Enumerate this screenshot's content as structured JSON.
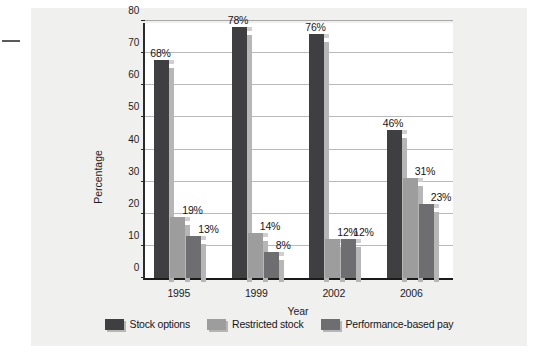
{
  "chart_data": {
    "type": "bar",
    "title": "",
    "xlabel": "Year",
    "ylabel": "Percentage",
    "categories": [
      "1995",
      "1999",
      "2002",
      "2006"
    ],
    "ylim": [
      0,
      80
    ],
    "yticks": [
      0,
      10,
      20,
      30,
      40,
      50,
      60,
      70,
      80
    ],
    "ytick_labels": [
      "0",
      "10",
      "20",
      "30",
      "40",
      "50",
      "60",
      "70",
      "80"
    ],
    "grid": true,
    "legend_position": "bottom",
    "value_suffix": "%",
    "series": [
      {
        "name": "Stock options",
        "color": "#3f3f41",
        "values": [
          68,
          78,
          76,
          46
        ],
        "labels": [
          "68%",
          "78%",
          "76%",
          "46%"
        ]
      },
      {
        "name": "Restricted stock",
        "color": "#9d9d9d",
        "values": [
          19,
          14,
          12,
          31
        ],
        "labels": [
          "19%",
          "14%",
          "12%",
          "31%"
        ]
      },
      {
        "name": "Performance-based pay",
        "color": "#6e6e70",
        "values": [
          13,
          8,
          12,
          23
        ],
        "labels": [
          "13%",
          "8%",
          "12%",
          "23%"
        ]
      }
    ]
  },
  "legend": {
    "items": [
      {
        "label": "Stock options",
        "color": "#3f3f41"
      },
      {
        "label": "Restricted stock",
        "color": "#9d9d9d"
      },
      {
        "label": "Performance-based pay",
        "color": "#6e6e70"
      }
    ]
  },
  "axes": {
    "y_title": "Percentage",
    "x_title": "Year"
  }
}
